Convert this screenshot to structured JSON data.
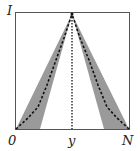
{
  "diagram": {
    "labels": {
      "y_top": "I",
      "x_left": "0",
      "x_mid": "y",
      "x_right": "N"
    },
    "colors": {
      "frame": "#555555",
      "band": "#9a9a9a",
      "curve": "#111111",
      "background": "#ffffff"
    }
  }
}
